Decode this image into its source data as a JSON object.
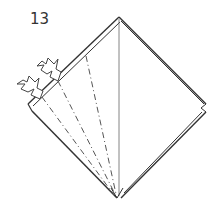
{
  "diagram": {
    "step_number": "13",
    "type": "origami-fold-step",
    "colors": {
      "line": "#333333",
      "fold_line": "#555555",
      "background": "#ffffff"
    },
    "elements": [
      {
        "name": "paper-square",
        "shape": "diamond"
      },
      {
        "name": "center-crease",
        "style": "thin-solid"
      },
      {
        "name": "valley-fold-lines",
        "style": "dash-dot",
        "count": 3
      },
      {
        "name": "push-arrows",
        "count": 2
      }
    ]
  }
}
